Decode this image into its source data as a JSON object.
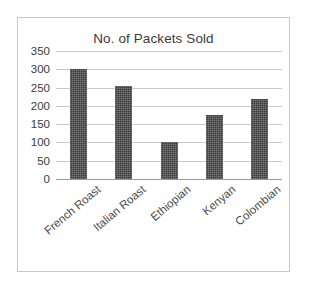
{
  "chart_data": {
    "type": "bar",
    "title": "No. of Packets Sold",
    "categories": [
      "French Roast",
      "Italian Roast",
      "Ethiopian",
      "Kenyan",
      "Colombian"
    ],
    "values": [
      300,
      255,
      100,
      175,
      220
    ],
    "xlabel": "",
    "ylabel": "",
    "ylim": [
      0,
      350
    ],
    "ytick_step": 50,
    "yticks": [
      0,
      50,
      100,
      150,
      200,
      250,
      300,
      350
    ],
    "ytick_labels": [
      "0",
      "50",
      "100",
      "150",
      "200",
      "250",
      "300",
      "350"
    ],
    "grid": true,
    "grid_axis": "y",
    "legend": false,
    "legend_position": "none",
    "bar_color": "#3d3d3d",
    "grid_color": "#c9c9c9",
    "axis_color": "#9a9a9a",
    "text_color": "#3b3b3b",
    "frame_color": "#c8c8c8",
    "background": "#ffffff",
    "label_rotation": -40
  }
}
